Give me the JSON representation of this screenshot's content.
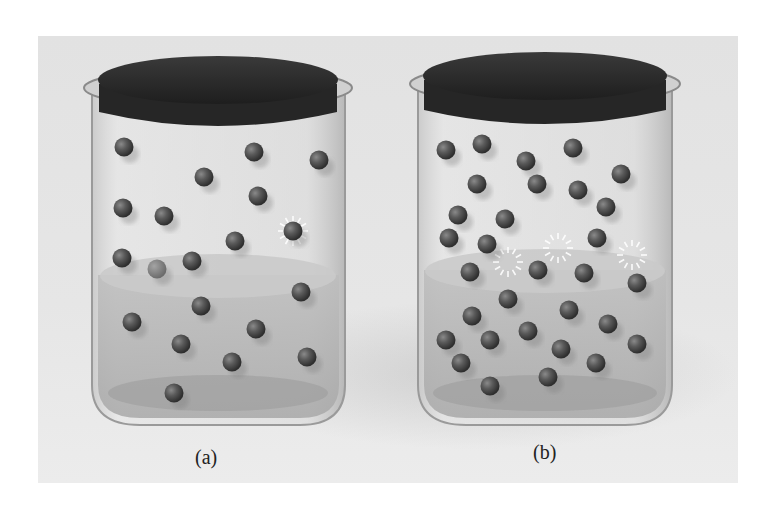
{
  "figure": {
    "background_color": "#e4e4e4",
    "jars": [
      {
        "id": "a",
        "label": "(a)",
        "label_pos": [
          209,
          458
        ],
        "vapor_molecules": [
          [
            124,
            147
          ],
          [
            254,
            152
          ],
          [
            319,
            160
          ],
          [
            204,
            177
          ],
          [
            123,
            208
          ],
          [
            258,
            196
          ],
          [
            164,
            216
          ],
          [
            293,
            231
          ],
          [
            235,
            241
          ],
          [
            122,
            258
          ],
          [
            192,
            261
          ],
          [
            157,
            269
          ]
        ],
        "condensing_molecules": [
          [
            293,
            231
          ]
        ],
        "liquid_molecules": [
          [
            301,
            292
          ],
          [
            201,
            306
          ],
          [
            132,
            322
          ],
          [
            256,
            329
          ],
          [
            181,
            344
          ],
          [
            232,
            362
          ],
          [
            307,
            357
          ],
          [
            174,
            393
          ]
        ],
        "liquid_surface_y": 275
      },
      {
        "id": "b",
        "label": "(b)",
        "label_pos": [
          547,
          453
        ],
        "vapor_molecules": [
          [
            446,
            150
          ],
          [
            482,
            144
          ],
          [
            526,
            161
          ],
          [
            573,
            148
          ],
          [
            621,
            174
          ],
          [
            477,
            184
          ],
          [
            537,
            184
          ],
          [
            578,
            190
          ],
          [
            458,
            215
          ],
          [
            505,
            219
          ],
          [
            606,
            207
          ],
          [
            449,
            238
          ],
          [
            487,
            244
          ],
          [
            597,
            238
          ]
        ],
        "condensing_molecules": [
          [
            558,
            248
          ],
          [
            632,
            255
          ],
          [
            508,
            262
          ]
        ],
        "liquid_molecules": [
          [
            470,
            272
          ],
          [
            538,
            270
          ],
          [
            584,
            273
          ],
          [
            637,
            283
          ],
          [
            508,
            299
          ],
          [
            472,
            316
          ],
          [
            569,
            310
          ],
          [
            608,
            324
          ],
          [
            446,
            340
          ],
          [
            490,
            340
          ],
          [
            528,
            331
          ],
          [
            637,
            344
          ],
          [
            561,
            349
          ],
          [
            461,
            363
          ],
          [
            596,
            363
          ],
          [
            490,
            386
          ],
          [
            548,
            377
          ]
        ],
        "liquid_surface_y": 272
      }
    ]
  }
}
